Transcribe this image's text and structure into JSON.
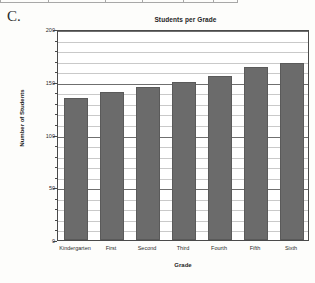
{
  "page": {
    "figure_label": "C."
  },
  "chart_data": {
    "type": "bar",
    "title": "Students per Grade",
    "xlabel": "Grade",
    "ylabel": "Number of Students",
    "categories": [
      "Kindergarten",
      "First",
      "Second",
      "Third",
      "Fourth",
      "Fifth",
      "Sixth"
    ],
    "values": [
      135,
      140,
      145,
      150,
      155,
      164,
      168
    ],
    "ylim": [
      0,
      200
    ],
    "ytick_labels": [
      "0",
      "50",
      "100",
      "150",
      "200"
    ],
    "ytick_values": [
      0,
      50,
      100,
      150,
      200
    ],
    "minor_tick_step": 10,
    "grid": true,
    "legend": null,
    "bar_color": "#6b6b6b",
    "grid_color": "#c9c9c9",
    "axis_color": "#4a4a4a",
    "plot_background": "#ffffff"
  }
}
